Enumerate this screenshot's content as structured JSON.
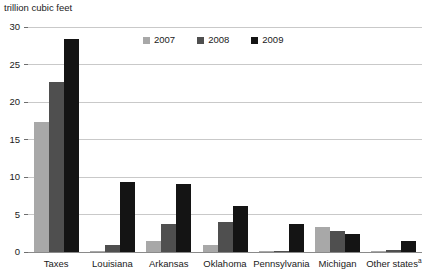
{
  "chart_data": {
    "type": "bar",
    "title": "",
    "ylabel": "trillion cubic feet",
    "xlabel": "",
    "ylim": [
      0,
      30
    ],
    "yticks": [
      0,
      5,
      10,
      15,
      20,
      25,
      30
    ],
    "ytick_labels": [
      "0",
      "5",
      "10",
      "15",
      "20",
      "25",
      "30"
    ],
    "grid": true,
    "legend_position": "top-center",
    "categories": [
      "Taxes",
      "Louisiana",
      "Arkansas",
      "Oklahoma",
      "Pennsylvania",
      "Michigan",
      "Other states"
    ],
    "category_footnotes": [
      "",
      "",
      "",
      "",
      "",
      "",
      "a"
    ],
    "series": [
      {
        "name": "2007",
        "color": "#a8a8a8",
        "values": [
          17.3,
          0.1,
          1.5,
          1.0,
          0.1,
          3.4,
          0.1
        ]
      },
      {
        "name": "2008",
        "color": "#4f4f4f",
        "values": [
          22.7,
          1.0,
          3.8,
          4.0,
          0.2,
          2.8,
          0.3
        ]
      },
      {
        "name": "2009",
        "color": "#141414",
        "values": [
          28.4,
          9.4,
          9.1,
          6.2,
          3.8,
          2.4,
          1.5
        ]
      }
    ]
  }
}
